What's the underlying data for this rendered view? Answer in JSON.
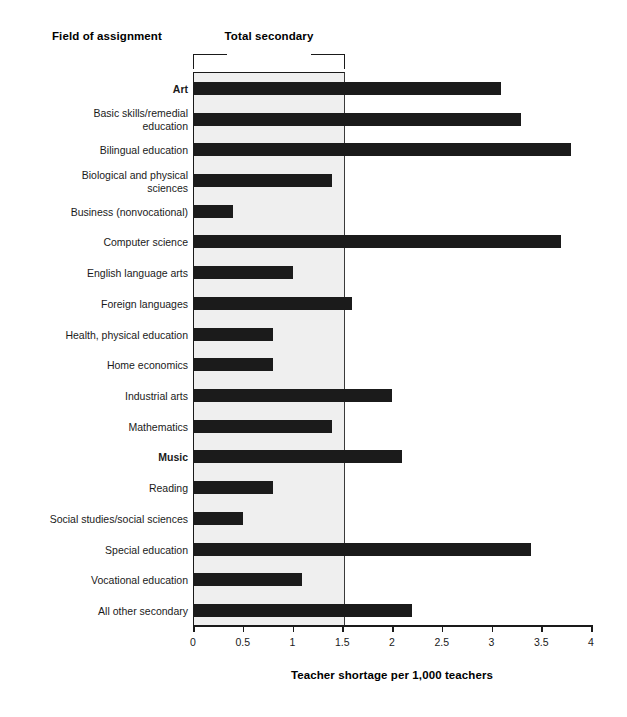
{
  "header": {
    "field_heading": "Field of assignment",
    "group_heading": "Total secondary"
  },
  "axis": {
    "title": "Teacher shortage per 1,000 teachers",
    "ticks": [
      "0",
      "0.5",
      "1",
      "1.5",
      "2",
      "2.5",
      "3",
      "3.5",
      "4"
    ]
  },
  "colors": {
    "bar": "#1b1b1b",
    "band": "#efefef",
    "axis": "#1a1a1a",
    "background": "#ffffff"
  },
  "chart_data": {
    "type": "bar",
    "orientation": "horizontal",
    "title": "",
    "xlabel": "Teacher shortage per 1,000 teachers",
    "ylabel": "Field of assignment",
    "xlim": [
      0,
      4
    ],
    "xticks": [
      0,
      0.5,
      1,
      1.5,
      2,
      2.5,
      3,
      3.5,
      4
    ],
    "grid": false,
    "legend": null,
    "annotations": [
      {
        "text": "Total secondary",
        "type": "bracket",
        "span": [
          0,
          1.5
        ]
      }
    ],
    "highlight_band": {
      "label": "Total secondary",
      "from": 0,
      "to": 1.5,
      "fill": "#efefef"
    },
    "categories": [
      "Art",
      "Basic skills/remedial\neducation",
      "Bilingual education",
      "Biological and physical\nsciences",
      "Business (nonvocational)",
      "Computer science",
      "English language arts",
      "Foreign languages",
      "Health, physical education",
      "Home economics",
      "Industrial arts",
      "Mathematics",
      "Music",
      "Reading",
      "Social studies/social sciences",
      "Special education",
      "Vocational education",
      "All other secondary"
    ],
    "bold_categories": [
      "Art",
      "Music"
    ],
    "values": [
      3.1,
      3.3,
      3.8,
      1.4,
      0.4,
      3.7,
      1.0,
      1.6,
      0.8,
      0.8,
      2.0,
      1.4,
      2.1,
      0.8,
      0.5,
      3.4,
      1.1,
      2.2
    ]
  }
}
